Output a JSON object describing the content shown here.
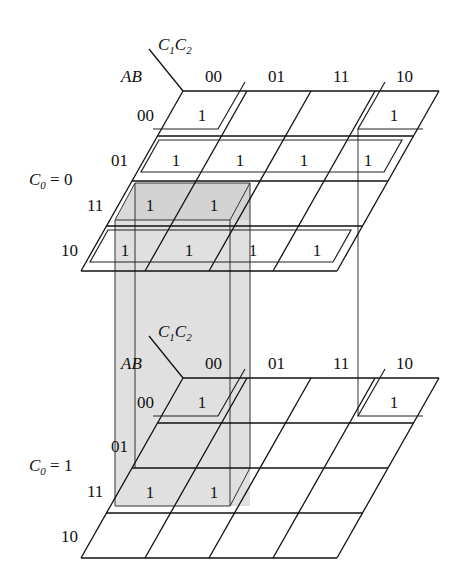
{
  "figure": {
    "row_var_label": "AB",
    "col_var_label_main": "C",
    "col_var_sub1": "1",
    "col_var_sub2": "2",
    "col_headers": [
      "00",
      "01",
      "11",
      "10"
    ],
    "row_headers": [
      "00",
      "01",
      "11",
      "10"
    ],
    "layers": [
      {
        "label_main": "C",
        "label_sub": "0",
        "label_eq": " = 0",
        "cells": [
          [
            "1",
            "",
            "",
            "1"
          ],
          [
            "1",
            "1",
            "1",
            "1"
          ],
          [
            "1",
            "1",
            "",
            ""
          ],
          [
            "1",
            "1",
            "1",
            "1"
          ]
        ]
      },
      {
        "label_main": "C",
        "label_sub": "0",
        "label_eq": " = 1",
        "cells": [
          [
            "1",
            "",
            "",
            "1"
          ],
          [
            "",
            "",
            "",
            ""
          ],
          [
            "1",
            "1",
            "",
            ""
          ],
          [
            "",
            "",
            "",
            ""
          ]
        ]
      }
    ],
    "groupings": [
      "Corner quad in row AB=00 (cols 00 & 10) spanning both layers",
      "Row AB=01 (all four cells) in C0=0 layer",
      "Row AB=10 (all four cells) in C0=0 layer",
      "Shaded box: AB=11, C1C2=00/01 spanning both layers"
    ],
    "colors": {
      "line": "#111111",
      "shade": "#d9d9d9",
      "background": "#ffffff"
    }
  }
}
